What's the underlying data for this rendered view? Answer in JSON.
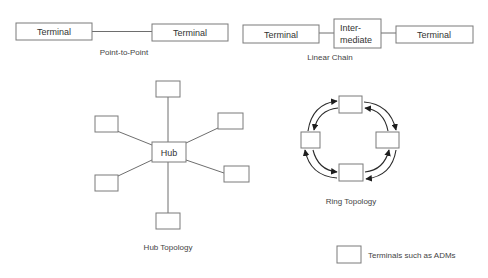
{
  "diagram": {
    "point_to_point": {
      "terminal_a": "Terminal",
      "terminal_b": "Terminal",
      "caption": "Point-to-Point"
    },
    "linear_chain": {
      "terminal_a": "Terminal",
      "intermediate_line1": "Inter-",
      "intermediate_line2": "mediate",
      "terminal_b": "Terminal",
      "caption": "Linear Chain"
    },
    "hub": {
      "center": "Hub",
      "spoke_count": 6,
      "caption": "Hub Topology"
    },
    "ring": {
      "node_count": 4,
      "caption": "Ring Topology"
    },
    "legend": {
      "text": "Terminals such as ADMs"
    },
    "colors": {
      "box_stroke": "#7a7a7a",
      "line": "#6e6e6e",
      "arrow": "#2a2a2a",
      "text": "#333333"
    }
  }
}
